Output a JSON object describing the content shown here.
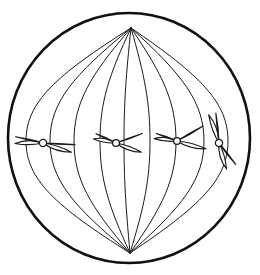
{
  "figure": {
    "kind": "cell-biology-diagram",
    "background_color": "#ffffff",
    "line_color": "#1a1a1a",
    "fill_color": "#ffffff",
    "canvas": {
      "width": 260,
      "height": 275
    }
  },
  "cell": {
    "label": "Cell membrane",
    "shape": "ellipse",
    "cx": 129,
    "cy": 138,
    "rx": 121,
    "ry": 125,
    "stroke_width": 2.6,
    "stroke_color": "#111111"
  },
  "poles": {
    "label": "Spindle poles",
    "top": {
      "name": "top-pole",
      "x": 131,
      "y": 28
    },
    "bottom": {
      "name": "bottom-pole",
      "x": 130,
      "y": 253
    }
  },
  "spindle": {
    "label": "Spindle apparatus",
    "fiber_count": 9,
    "stroke_width": 1.0,
    "stroke_color": "#1a1a1a",
    "fibers": [
      {
        "name": "spindle-fiber-1",
        "equator_x": 26,
        "bow": -1.0
      },
      {
        "name": "spindle-fiber-2",
        "equator_x": 50,
        "bow": -0.76
      },
      {
        "name": "spindle-fiber-3",
        "equator_x": 74,
        "bow": -0.52
      },
      {
        "name": "spindle-fiber-4",
        "equator_x": 100,
        "bow": -0.28
      },
      {
        "name": "spindle-fiber-5",
        "equator_x": 124,
        "bow": -0.05
      },
      {
        "name": "spindle-fiber-6",
        "equator_x": 150,
        "bow": 0.2
      },
      {
        "name": "spindle-fiber-7",
        "equator_x": 176,
        "bow": 0.46
      },
      {
        "name": "spindle-fiber-8",
        "equator_x": 204,
        "bow": 0.72
      },
      {
        "name": "spindle-fiber-9",
        "equator_x": 228,
        "bow": 0.96
      }
    ]
  },
  "metaphase_plate": {
    "label": "Metaphase plate (equator)",
    "y": 141
  },
  "chromosomes": [
    {
      "name": "chromosome-1",
      "label": "Chromosome 1",
      "centromere": {
        "cx": 43,
        "cy": 143,
        "r": 3.6
      },
      "rotation": -4,
      "arms": [
        {
          "name": "chromatid-arm-upper-left",
          "angle": 183,
          "length": 28,
          "width": 6.5,
          "curve": 7
        },
        {
          "name": "chromatid-arm-upper-right",
          "angle": 7,
          "length": 32,
          "width": 6.5,
          "curve": -8
        },
        {
          "name": "chromatid-arm-lower-left",
          "angle": 197,
          "length": 28,
          "width": 6.5,
          "curve": -7
        },
        {
          "name": "chromatid-arm-lower-right",
          "angle": 22,
          "length": 30,
          "width": 6.5,
          "curve": 6
        }
      ]
    },
    {
      "name": "chromosome-2",
      "label": "Chromosome 2",
      "centromere": {
        "cx": 116,
        "cy": 143,
        "r": 3.4
      },
      "rotation": 0,
      "arms": [
        {
          "name": "chromatid-arm-upper-left",
          "angle": 190,
          "length": 23,
          "width": 6.0,
          "curve": 6
        },
        {
          "name": "chromatid-arm-upper-right",
          "angle": 340,
          "length": 28,
          "width": 6.0,
          "curve": -7
        },
        {
          "name": "chromatid-arm-lower-left",
          "angle": 205,
          "length": 22,
          "width": 6.0,
          "curve": -6
        },
        {
          "name": "chromatid-arm-lower-right",
          "angle": 20,
          "length": 27,
          "width": 6.0,
          "curve": 6
        }
      ]
    },
    {
      "name": "chromosome-3",
      "label": "Chromosome 3",
      "centromere": {
        "cx": 177,
        "cy": 141,
        "r": 3.4
      },
      "rotation": 0,
      "arms": [
        {
          "name": "chromatid-arm-upper-left",
          "angle": 186,
          "length": 23,
          "width": 6.0,
          "curve": 6
        },
        {
          "name": "chromatid-arm-upper-right",
          "angle": 330,
          "length": 30,
          "width": 6.0,
          "curve": -6
        },
        {
          "name": "chromatid-arm-lower-left",
          "angle": 200,
          "length": 22,
          "width": 6.0,
          "curve": -6
        },
        {
          "name": "chromatid-arm-lower-right",
          "angle": 15,
          "length": 30,
          "width": 6.0,
          "curve": 7
        }
      ]
    },
    {
      "name": "chromosome-4",
      "label": "Chromosome 4",
      "centromere": {
        "cx": 219,
        "cy": 143,
        "r": 3.6
      },
      "rotation": 62,
      "arms": [
        {
          "name": "chromatid-arm-upper-left",
          "angle": 188,
          "length": 30,
          "width": 6.5,
          "curve": 7
        },
        {
          "name": "chromatid-arm-upper-right",
          "angle": 350,
          "length": 27,
          "width": 6.5,
          "curve": -7
        },
        {
          "name": "chromatid-arm-lower-left",
          "angle": 202,
          "length": 30,
          "width": 6.5,
          "curve": -7
        },
        {
          "name": "chromatid-arm-lower-right",
          "angle": 12,
          "length": 27,
          "width": 6.5,
          "curve": 7
        }
      ]
    }
  ]
}
